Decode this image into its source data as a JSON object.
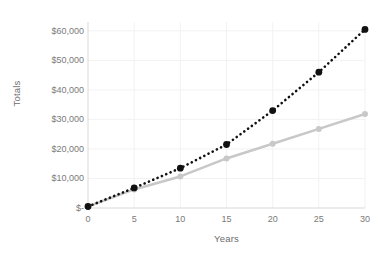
{
  "chart_data": {
    "type": "line",
    "title": "",
    "xlabel": "Years",
    "ylabel": "Totals",
    "x": [
      0,
      5,
      10,
      15,
      20,
      25,
      30
    ],
    "xtick_labels": [
      "0",
      "5",
      "10",
      "15",
      "20",
      "25",
      "30"
    ],
    "ytick_labels": [
      "$-",
      "$10,000",
      "$20,000",
      "$30,000",
      "$40,000",
      "$50,000",
      "$60,000"
    ],
    "ytick_values": [
      0,
      10000,
      20000,
      30000,
      40000,
      50000,
      60000
    ],
    "xlim": [
      0,
      30
    ],
    "ylim": [
      0,
      63000
    ],
    "grid": true,
    "legend": "none",
    "series": [
      {
        "name": "compound-growth",
        "style": "dotted",
        "color": "#111111",
        "marker": "circle",
        "values": [
          500,
          6800,
          13500,
          21500,
          33000,
          46000,
          60500
        ]
      },
      {
        "name": "linear-growth",
        "style": "solid",
        "color": "#c8c8c8",
        "marker": "circle",
        "values": [
          500,
          6300,
          10700,
          16800,
          21800,
          26800,
          31800
        ]
      }
    ]
  },
  "axis": {
    "y_title": "Totals",
    "x_title": "Years"
  },
  "colors": {
    "series_dark": "#111111",
    "series_light": "#c8c8c8",
    "grid": "#f2f2f2",
    "axis_line": "#d9d9d9",
    "tick_text": "#7a7a7a",
    "axis_title_text": "#6b6b6b",
    "background": "#ffffff"
  }
}
